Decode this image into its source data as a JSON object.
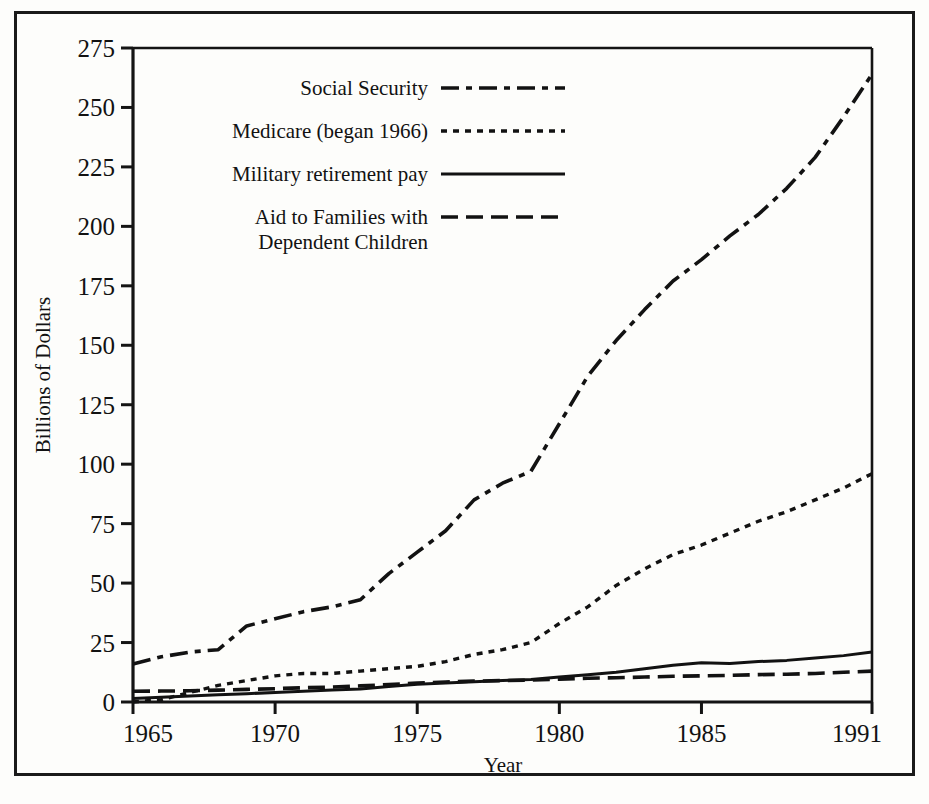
{
  "figure": {
    "background_color": "#fdfdfb",
    "ink_color": "#121212",
    "has_outer_border": true
  },
  "chart_data": {
    "type": "line",
    "title": "",
    "subtitle": "",
    "xlabel": "Year",
    "ylabel": "Billions of Dollars",
    "xlim": [
      1965,
      1991
    ],
    "ylim": [
      0,
      275
    ],
    "xticks": [
      1965,
      1970,
      1975,
      1980,
      1985,
      1991
    ],
    "xtick_labels": [
      "1965",
      "1970",
      "1975",
      "1980",
      "1985",
      "1991"
    ],
    "yticks": [
      0,
      25,
      50,
      75,
      100,
      125,
      150,
      175,
      200,
      225,
      250,
      275
    ],
    "ytick_labels": [
      "0",
      "25",
      "50",
      "75",
      "100",
      "125",
      "150",
      "175",
      "200",
      "225",
      "250",
      "275"
    ],
    "grid": false,
    "legend_position": "upper-left-inside",
    "x": [
      1965,
      1966,
      1967,
      1968,
      1969,
      1970,
      1971,
      1972,
      1973,
      1974,
      1975,
      1976,
      1977,
      1978,
      1979,
      1980,
      1981,
      1982,
      1983,
      1984,
      1985,
      1986,
      1987,
      1988,
      1989,
      1990,
      1991
    ],
    "series": [
      {
        "name": "Social Security",
        "dash_style": "dash-dot",
        "values": [
          16,
          19,
          21,
          22,
          32,
          35,
          38,
          40,
          43,
          54,
          63,
          72,
          85,
          92,
          97,
          117,
          137,
          152,
          165,
          177,
          186,
          196,
          205,
          216,
          229,
          246,
          264
        ]
      },
      {
        "name": "Medicare (began 1966)",
        "dash_style": "dotted",
        "values": [
          0,
          1,
          4,
          7,
          9,
          11,
          12,
          12,
          13,
          14,
          15,
          17,
          20,
          22,
          25,
          33,
          40,
          49,
          56,
          62,
          66,
          71,
          76,
          80,
          85,
          90,
          96
        ]
      },
      {
        "name": "Military retirement pay",
        "dash_style": "solid",
        "values": [
          1.5,
          2,
          2.5,
          3,
          3.5,
          4,
          4.5,
          5,
          5.5,
          6.5,
          7.5,
          8,
          8.5,
          9,
          9.5,
          10.5,
          11.5,
          12.5,
          14,
          15.5,
          16.5,
          16.2,
          17,
          17.5,
          18.5,
          19.5,
          21
        ]
      },
      {
        "name": "Aid to Families with Dependent Children",
        "dash_style": "long-dash",
        "values": [
          4.5,
          4.6,
          4.7,
          5,
          5.3,
          5.6,
          6,
          6.3,
          6.8,
          7.3,
          8,
          8.4,
          8.8,
          9,
          9.2,
          9.6,
          10,
          10.2,
          10.5,
          10.8,
          11,
          11.2,
          11.5,
          11.7,
          12,
          12.5,
          13
        ]
      }
    ]
  },
  "legend": {
    "entries": [
      {
        "label": "Social Security",
        "label2": "",
        "style": "dash-dot"
      },
      {
        "label": "Medicare (began 1966)",
        "label2": "",
        "style": "dotted"
      },
      {
        "label": "Military retirement pay",
        "label2": "",
        "style": "solid"
      },
      {
        "label": "Aid to Families with",
        "label2": "Dependent Children",
        "style": "long-dash"
      }
    ]
  }
}
